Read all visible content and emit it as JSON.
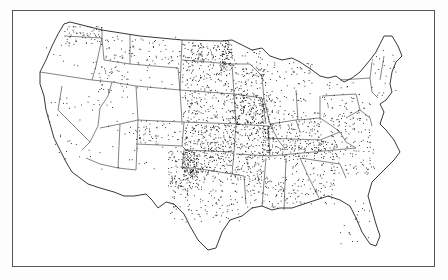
{
  "map": {
    "type": "dot-distribution",
    "region": "Contiguous United States",
    "labels": [],
    "frame": {
      "x": 12,
      "y": 10,
      "width": 423,
      "height": 257,
      "color": "#555555"
    },
    "colors": {
      "land": "#ffffff",
      "border": "#222222",
      "dot": "#111111",
      "background": "#fdfdfd"
    },
    "outline": "M64,24 L70,22 L102,30 L140,36 L182,40 L222,41 L232,40 L240,44 L252,50 L262,48 L270,56 L282,60 L292,58 L300,62 L312,70 L320,76 L328,78 L336,76 L344,82 L352,78 L360,72 L370,60 L376,52 L380,44 L384,36 L392,36 L398,46 L402,56 L396,62 L392,72 L390,84 L392,92 L386,100 L380,104 L384,112 L380,124 L386,130 L394,140 L400,152 L394,160 L384,170 L372,182 L368,196 L372,210 L376,224 L380,236 L376,246 L370,244 L362,232 L356,218 L350,206 L340,200 L328,196 L316,200 L304,204 L292,208 L280,208 L272,210 L262,206 L252,208 L242,216 L230,220 L222,232 L216,248 L208,250 L198,240 L190,226 L184,214 L174,204 L166,202 L158,208 L152,200 L146,194 L134,196 L124,196 L114,192 L100,188 L88,184 L80,178 L72,172 L66,162 L60,150 L54,138 L50,124 L46,110 L44,96 L40,84 L40,72 L46,60 L52,46 L58,34 Z",
    "state_lines": [
      "M64,36 L102,38 L102,30",
      "M40,72 L92,80 L112,82",
      "M102,38 L96,66 L92,80",
      "M112,82 L108,96 L100,108 L98,126 L90,142 L82,150",
      "M62,86 L58,110 L90,142",
      "M112,82 L136,86 L138,120 L120,124 L100,128",
      "M136,86 L180,90 L182,122 L138,120",
      "M130,64 L178,68 L180,90",
      "M102,38 L104,60 L130,64 L130,34",
      "M182,40 L180,90",
      "M182,60 L232,64",
      "M180,90 L234,94",
      "M182,122 L240,124",
      "M120,124 L118,168 L100,164 L86,158",
      "M138,120 L136,170 L118,168",
      "M136,144 L182,146 L184,122",
      "M182,146 L186,150 L234,152 L236,124",
      "M184,150 L182,168 L194,168 L232,174 L234,152",
      "M232,64 L234,94 L236,124",
      "M232,64 L250,64 L262,76",
      "M234,94 L262,98 L266,124",
      "M236,124 L268,126 L270,156 L236,154",
      "M232,174 L244,176 L246,204",
      "M262,76 L264,100 L270,124 L278,140 L286,150",
      "M270,124 L296,120 L300,132",
      "M296,90 L298,120 L320,118",
      "M264,138 L320,140 L340,132",
      "M270,156 L356,148",
      "M266,158 L262,206",
      "M286,158 L284,210",
      "M300,158 L310,180 L318,196",
      "M300,158 L340,164 L346,178",
      "M320,96 L320,118 L332,126 L340,132 L346,142 L356,148",
      "M322,96 L356,94 L360,110 L346,118",
      "M340,80 L370,78 L372,62",
      "M370,78 L372,92 L378,98",
      "M384,56 L380,80",
      "M360,110 L370,118 L372,126"
    ],
    "dot_regions": [
      {
        "name": "north-dakota",
        "x": 182,
        "y": 42,
        "w": 50,
        "h": 20,
        "count": 120
      },
      {
        "name": "red-river-valley",
        "x": 220,
        "y": 40,
        "w": 12,
        "h": 30,
        "count": 60
      },
      {
        "name": "south-dakota",
        "x": 182,
        "y": 62,
        "w": 50,
        "h": 30,
        "count": 110
      },
      {
        "name": "minnesota",
        "x": 232,
        "y": 50,
        "w": 30,
        "h": 44,
        "count": 90
      },
      {
        "name": "nebraska",
        "x": 182,
        "y": 92,
        "w": 52,
        "h": 30,
        "count": 130
      },
      {
        "name": "iowa",
        "x": 234,
        "y": 94,
        "w": 30,
        "h": 30,
        "count": 170
      },
      {
        "name": "kansas",
        "x": 184,
        "y": 124,
        "w": 52,
        "h": 26,
        "count": 180
      },
      {
        "name": "missouri",
        "x": 236,
        "y": 124,
        "w": 34,
        "h": 32,
        "count": 120
      },
      {
        "name": "illinois",
        "x": 262,
        "y": 98,
        "w": 18,
        "h": 56,
        "count": 100
      },
      {
        "name": "indiana-ohio",
        "x": 280,
        "y": 110,
        "w": 42,
        "h": 40,
        "count": 110
      },
      {
        "name": "michigan-wisconsin",
        "x": 262,
        "y": 62,
        "w": 50,
        "h": 40,
        "count": 80
      },
      {
        "name": "oklahoma",
        "x": 184,
        "y": 150,
        "w": 50,
        "h": 22,
        "count": 150
      },
      {
        "name": "texas-panhandle",
        "x": 182,
        "y": 150,
        "w": 16,
        "h": 30,
        "count": 110
      },
      {
        "name": "texas",
        "x": 170,
        "y": 172,
        "w": 72,
        "h": 50,
        "count": 170
      },
      {
        "name": "arkansas",
        "x": 234,
        "y": 156,
        "w": 30,
        "h": 24,
        "count": 70
      },
      {
        "name": "louisiana-mississippi",
        "x": 244,
        "y": 176,
        "w": 40,
        "h": 32,
        "count": 80
      },
      {
        "name": "kentucky-tennessee",
        "x": 268,
        "y": 140,
        "w": 70,
        "h": 20,
        "count": 110
      },
      {
        "name": "alabama-georgia",
        "x": 284,
        "y": 160,
        "w": 50,
        "h": 44,
        "count": 100
      },
      {
        "name": "carolinas",
        "x": 320,
        "y": 140,
        "w": 54,
        "h": 34,
        "count": 80
      },
      {
        "name": "virginia",
        "x": 330,
        "y": 118,
        "w": 40,
        "h": 24,
        "count": 50
      },
      {
        "name": "pennsylvania-ny",
        "x": 322,
        "y": 80,
        "w": 48,
        "h": 40,
        "count": 60
      },
      {
        "name": "new-england",
        "x": 370,
        "y": 40,
        "w": 26,
        "h": 56,
        "count": 22
      },
      {
        "name": "florida",
        "x": 340,
        "y": 200,
        "w": 32,
        "h": 44,
        "count": 20
      },
      {
        "name": "montana",
        "x": 104,
        "y": 36,
        "w": 76,
        "h": 28,
        "count": 80
      },
      {
        "name": "washington",
        "x": 64,
        "y": 26,
        "w": 38,
        "h": 18,
        "count": 60
      },
      {
        "name": "idaho",
        "x": 98,
        "y": 66,
        "w": 30,
        "h": 26,
        "count": 40
      },
      {
        "name": "colorado",
        "x": 138,
        "y": 120,
        "w": 44,
        "h": 24,
        "count": 50
      },
      {
        "name": "wyoming",
        "x": 130,
        "y": 64,
        "w": 50,
        "h": 26,
        "count": 12
      },
      {
        "name": "oregon",
        "x": 46,
        "y": 44,
        "w": 50,
        "h": 30,
        "count": 12
      },
      {
        "name": "california",
        "x": 44,
        "y": 90,
        "w": 50,
        "h": 70,
        "count": 30
      },
      {
        "name": "nevada-utah",
        "x": 92,
        "y": 84,
        "w": 46,
        "h": 56,
        "count": 16
      },
      {
        "name": "arizona-new-mexico",
        "x": 98,
        "y": 126,
        "w": 80,
        "h": 46,
        "count": 22
      },
      {
        "name": "new-mexico-east",
        "x": 168,
        "y": 150,
        "w": 14,
        "h": 36,
        "count": 50
      }
    ]
  }
}
